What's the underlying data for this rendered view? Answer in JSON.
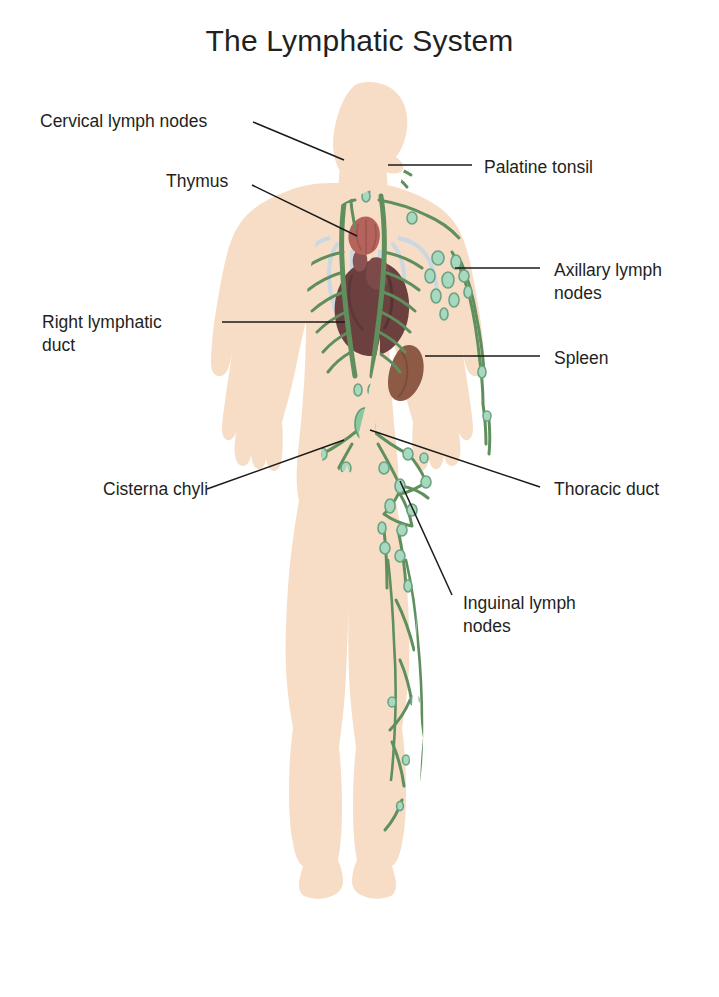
{
  "title": "The Lymphatic System",
  "colors": {
    "skin": "#f7ddc6",
    "skin_edge": "#f0cfb2",
    "vessel_green": "#5f8f5d",
    "node_green": "#a8d8bd",
    "node_stroke": "#6aa383",
    "heart": "#6d4040",
    "spleen": "#8d5a46",
    "thymus": "#b4645c",
    "tonsil": "#c07a62",
    "lung": "#c8dce8",
    "leader": "#1a1a1a",
    "text": "#231f20",
    "background": "#ffffff"
  },
  "labels": [
    {
      "id": "cervical-lymph-nodes",
      "text": "Cervical lymph nodes",
      "side": "left",
      "x": 40,
      "y": 110,
      "align": "left"
    },
    {
      "id": "thymus",
      "text": "Thymus",
      "side": "left",
      "x": 166,
      "y": 170,
      "align": "left"
    },
    {
      "id": "right-lymphatic-duct",
      "text": "Right lymphatic\nduct",
      "side": "left",
      "x": 42,
      "y": 311,
      "align": "left"
    },
    {
      "id": "cisterna-chyli",
      "text": "Cisterna chyli",
      "side": "left",
      "x": 103,
      "y": 478,
      "align": "left"
    },
    {
      "id": "palatine-tonsil",
      "text": "Palatine tonsil",
      "side": "right",
      "x": 484,
      "y": 156,
      "align": "left"
    },
    {
      "id": "axillary-lymph-nodes",
      "text": "Axillary lymph\nnodes",
      "side": "right",
      "x": 554,
      "y": 259,
      "align": "left"
    },
    {
      "id": "spleen",
      "text": "Spleen",
      "side": "right",
      "x": 554,
      "y": 347,
      "align": "left"
    },
    {
      "id": "thoracic-duct",
      "text": "Thoracic duct",
      "side": "right",
      "x": 554,
      "y": 478,
      "align": "left"
    },
    {
      "id": "inguinal-lymph-nodes",
      "text": "Inguinal lymph\nnodes",
      "side": "right",
      "x": 463,
      "y": 592,
      "align": "left"
    }
  ],
  "leader_lines": [
    {
      "id": "leader-cervical",
      "points": "253,122 344,160"
    },
    {
      "id": "leader-thymus",
      "points": "252,185 357,236"
    },
    {
      "id": "leader-right-duct",
      "points": "222,322 345,322"
    },
    {
      "id": "leader-cisterna",
      "points": "207,489 344,440"
    },
    {
      "id": "leader-tonsil",
      "points": "472,165 388,165"
    },
    {
      "id": "leader-axillary",
      "points": "540,268 455,268"
    },
    {
      "id": "leader-spleen",
      "points": "540,356 425,356"
    },
    {
      "id": "leader-thoracic",
      "points": "540,487 370,430"
    },
    {
      "id": "leader-inguinal",
      "points": "452,595 400,481"
    }
  ],
  "organs": [
    {
      "id": "palatine-tonsil-organ",
      "name": "palatine tonsil"
    },
    {
      "id": "thymus-organ",
      "name": "thymus"
    },
    {
      "id": "heart-organ",
      "name": "heart"
    },
    {
      "id": "spleen-organ",
      "name": "spleen"
    },
    {
      "id": "lung-outline",
      "name": "lung outline"
    },
    {
      "id": "cisterna-chyli-organ",
      "name": "cisterna chyli"
    },
    {
      "id": "thoracic-duct-vessel",
      "name": "thoracic duct"
    }
  ],
  "figure": {
    "node_regions": [
      "cervical",
      "axillary",
      "thoracic",
      "abdominal",
      "inguinal",
      "popliteal",
      "lower-limb"
    ]
  }
}
